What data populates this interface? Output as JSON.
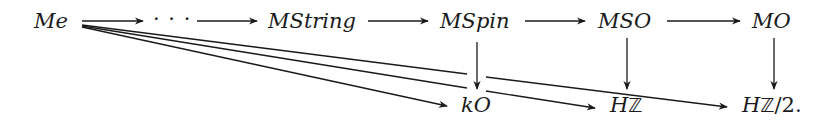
{
  "diagram": {
    "type": "commutative-diagram",
    "stroke_color": "#1a1a1a",
    "nodes": {
      "me": "Me",
      "dots": "· · ·",
      "mstring": "MString",
      "mspin": "MSpin",
      "mso": "MSO",
      "mo": "MO",
      "ko": "kO",
      "hz_h": "H",
      "hz_z": "ℤ",
      "hz2_h": "H",
      "hz2_z": "ℤ",
      "hz2_rest": "/2."
    },
    "edges": [
      {
        "from": "Me",
        "to": "···",
        "kind": "horizontal"
      },
      {
        "from": "···",
        "to": "MString",
        "kind": "horizontal"
      },
      {
        "from": "MString",
        "to": "MSpin",
        "kind": "horizontal"
      },
      {
        "from": "MSpin",
        "to": "MSO",
        "kind": "horizontal"
      },
      {
        "from": "MSO",
        "to": "MO",
        "kind": "horizontal"
      },
      {
        "from": "MSpin",
        "to": "kO",
        "kind": "vertical"
      },
      {
        "from": "MSO",
        "to": "HZ",
        "kind": "vertical"
      },
      {
        "from": "MO",
        "to": "HZ/2",
        "kind": "vertical"
      },
      {
        "from": "Me",
        "to": "kO",
        "kind": "diagonal"
      },
      {
        "from": "Me",
        "to": "HZ",
        "kind": "diagonal"
      },
      {
        "from": "Me",
        "to": "HZ/2",
        "kind": "diagonal"
      }
    ]
  }
}
